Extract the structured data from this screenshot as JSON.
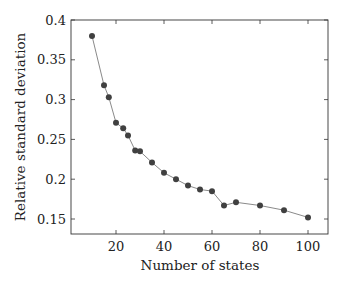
{
  "chart_data": {
    "type": "line",
    "title": "",
    "xlabel": "Number of states",
    "ylabel": "Relative standard deviation",
    "xlim": [
      2,
      112
    ],
    "ylim": [
      0.131,
      0.4
    ],
    "xticks": [
      20,
      40,
      60,
      80,
      100
    ],
    "xtick_labels": [
      "20",
      "40",
      "60",
      "80",
      "100"
    ],
    "yticks": [
      0.15,
      0.2,
      0.25,
      0.3,
      0.35,
      0.4
    ],
    "ytick_labels": [
      "0.15",
      "0.2",
      "0.25",
      "0.3",
      "0.35",
      "0.4"
    ],
    "grid": false,
    "legend": null,
    "series": [
      {
        "name": "Relative standard deviation",
        "marker": "circle",
        "x": [
          10,
          15,
          17,
          20,
          23,
          25,
          28,
          30,
          35,
          40,
          45,
          50,
          55,
          60,
          65,
          70,
          80,
          90,
          100
        ],
        "y": [
          0.38,
          0.318,
          0.303,
          0.271,
          0.264,
          0.255,
          0.236,
          0.235,
          0.221,
          0.208,
          0.2,
          0.192,
          0.187,
          0.185,
          0.167,
          0.171,
          0.167,
          0.161,
          0.152
        ]
      }
    ]
  },
  "colors": {
    "line": "#8a8a8a",
    "marker": "#404040",
    "axis": "#333333"
  }
}
